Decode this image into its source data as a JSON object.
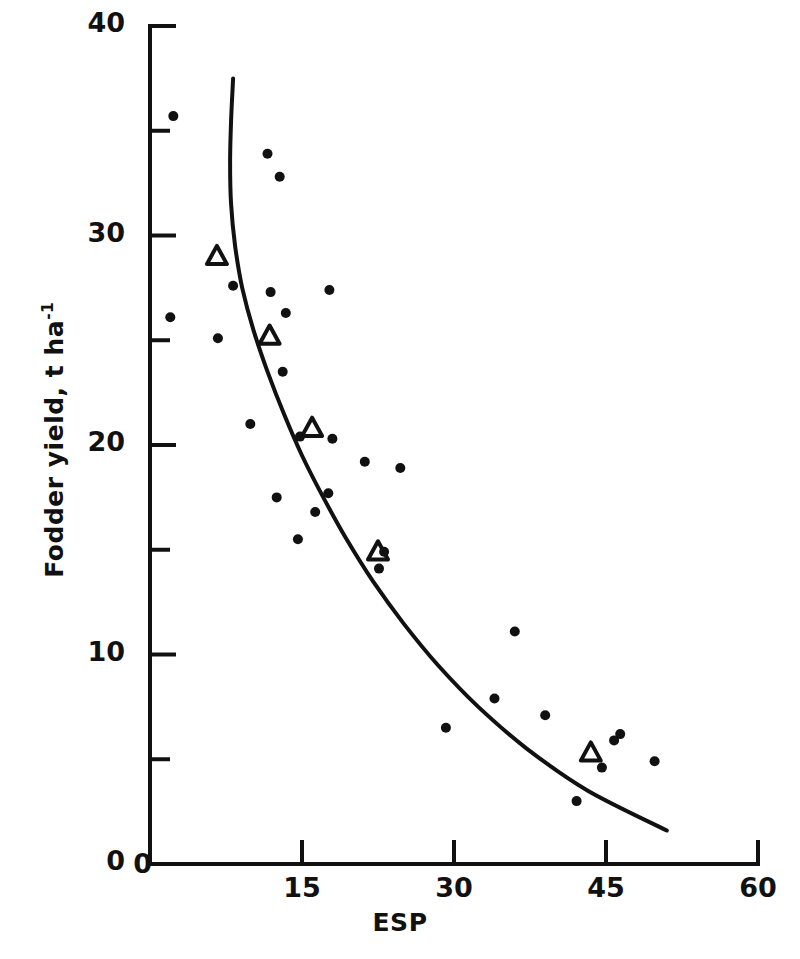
{
  "chart_data": {
    "type": "scatter",
    "title": "",
    "xlabel": "ESP",
    "ylabel": "Fodder yield, t ha-1",
    "ylabel_prefix": "Fodder yield, t ha",
    "ylabel_exponent": "-1",
    "xlim": [
      0,
      60
    ],
    "ylim": [
      0,
      40
    ],
    "xticks": [
      0,
      15,
      30,
      45,
      60
    ],
    "xtick_labels": [
      "0",
      "15",
      "30",
      "45",
      "60"
    ],
    "yticks": [
      0,
      10,
      20,
      30,
      40
    ],
    "ytick_labels": [
      "0",
      "10",
      "20",
      "30",
      "40"
    ],
    "x_minor_ticks": [],
    "y_minor_ticks": [
      5,
      15,
      25,
      35
    ],
    "grid": false,
    "legend": "none",
    "series": [
      {
        "name": "observations",
        "marker": "filled-circle",
        "color": "#111111",
        "points": [
          [
            2.3,
            35.7
          ],
          [
            11.6,
            33.9
          ],
          [
            12.8,
            32.8
          ],
          [
            2.0,
            26.1
          ],
          [
            8.2,
            27.6
          ],
          [
            11.9,
            27.3
          ],
          [
            17.7,
            27.4
          ],
          [
            13.4,
            26.3
          ],
          [
            6.7,
            25.1
          ],
          [
            13.1,
            23.5
          ],
          [
            9.9,
            21.0
          ],
          [
            14.8,
            20.4
          ],
          [
            18.0,
            20.3
          ],
          [
            21.2,
            19.2
          ],
          [
            24.7,
            18.9
          ],
          [
            17.6,
            17.7
          ],
          [
            12.5,
            17.5
          ],
          [
            16.3,
            16.8
          ],
          [
            14.6,
            15.5
          ],
          [
            23.1,
            14.9
          ],
          [
            22.6,
            14.1
          ],
          [
            36.0,
            11.1
          ],
          [
            34.0,
            7.9
          ],
          [
            29.2,
            6.5
          ],
          [
            39.0,
            7.1
          ],
          [
            46.4,
            6.2
          ],
          [
            44.6,
            4.6
          ],
          [
            49.8,
            4.9
          ],
          [
            42.1,
            3.0
          ],
          [
            45.8,
            5.9
          ]
        ]
      },
      {
        "name": "treatment means",
        "marker": "open-triangle",
        "color": "#111111",
        "points": [
          [
            6.6,
            29.0
          ],
          [
            11.8,
            25.2
          ],
          [
            16.0,
            20.8
          ],
          [
            22.5,
            14.9
          ],
          [
            43.5,
            5.3
          ]
        ]
      }
    ],
    "fitted_curve": {
      "name": "fitted response curve",
      "color": "#111111",
      "points": [
        [
          8.2,
          37.5
        ],
        [
          8.0,
          35.5
        ],
        [
          7.9,
          33.5
        ],
        [
          8.0,
          31.5
        ],
        [
          8.4,
          29.5
        ],
        [
          9.1,
          27.5
        ],
        [
          10.2,
          25.5
        ],
        [
          11.6,
          23.5
        ],
        [
          13.2,
          21.5
        ],
        [
          15.0,
          19.5
        ],
        [
          17.1,
          17.5
        ],
        [
          19.4,
          15.5
        ],
        [
          22.0,
          13.5
        ],
        [
          25.0,
          11.5
        ],
        [
          28.4,
          9.5
        ],
        [
          32.4,
          7.5
        ],
        [
          37.2,
          5.5
        ],
        [
          43.2,
          3.5
        ],
        [
          51.0,
          1.6
        ]
      ]
    }
  }
}
